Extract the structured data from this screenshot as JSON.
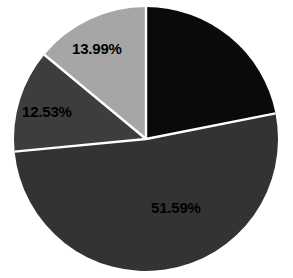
{
  "chart_data": {
    "type": "pie",
    "title": "",
    "subtitle": "",
    "xlabel": "",
    "ylabel": "",
    "legend": false,
    "legend_position": "none",
    "grid": false,
    "background_color": "#ffffff",
    "separator_color": "#ffffff",
    "label_color": "#000000",
    "start_angle_deg": 0,
    "direction": "clockwise",
    "center": {
      "x": 146,
      "y": 139
    },
    "radius": 132,
    "slices": [
      {
        "name": "slice-1",
        "label": "",
        "value": 21.89,
        "color": "#0a0a0a",
        "label_visible": false,
        "position": "top-right"
      },
      {
        "name": "slice-2",
        "label": "51.59%",
        "value": 51.59,
        "color": "#333333",
        "label_visible": true,
        "position": "bottom"
      },
      {
        "name": "slice-3",
        "label": "12.53%",
        "value": 12.53,
        "color": "#3d3d3d",
        "label_visible": true,
        "position": "left"
      },
      {
        "name": "slice-4",
        "label": "13.99%",
        "value": 13.99,
        "color": "#a6a6a6",
        "label_visible": true,
        "position": "top-left"
      }
    ],
    "labels_rendered": [
      "13.99%",
      "12.53%",
      "51.59%"
    ]
  }
}
